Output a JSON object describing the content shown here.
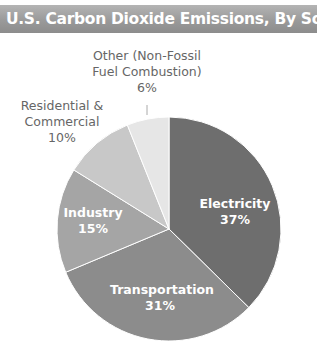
{
  "header": {
    "title": "U.S. Carbon Dioxide Emissions, By Source"
  },
  "chart_data": {
    "type": "pie",
    "title": "U.S. Carbon Dioxide Emissions, By Source",
    "categories": [
      "Electricity",
      "Transportation",
      "Industry",
      "Residential & Commercial",
      "Other (Non-Fossil Fuel Combustion)"
    ],
    "values": [
      37,
      31,
      15,
      10,
      6
    ],
    "unit": "%",
    "colors": [
      "#6e6e6e",
      "#8c8c8c",
      "#a5a5a5",
      "#c8c8c8",
      "#e6e6e6"
    ],
    "start_angle_deg": 0,
    "direction": "clockwise",
    "legend": "none",
    "labels": [
      {
        "name": "Electricity",
        "pct": "37%"
      },
      {
        "name": "Transportation",
        "pct": "31%"
      },
      {
        "name": "Industry",
        "pct": "15%"
      },
      {
        "name_line1": "Residential &",
        "name_line2": "Commercial",
        "pct": "10%"
      },
      {
        "name_line1": "Other (Non-Fossil",
        "name_line2": "Fuel Combustion)",
        "pct": "6%"
      }
    ]
  }
}
